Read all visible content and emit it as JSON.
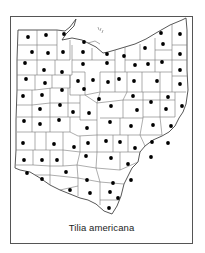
{
  "map": {
    "title": "Tilia americana",
    "region": "Ohio",
    "subdivision": "counties",
    "colors": {
      "border": "#555555",
      "county_lines": "#777777",
      "dot": "#000000",
      "background": "#ffffff"
    },
    "dots": [
      [
        28,
        37
      ],
      [
        46,
        35
      ],
      [
        64,
        34
      ],
      [
        84,
        42
      ],
      [
        161,
        33
      ],
      [
        180,
        34
      ],
      [
        32,
        52
      ],
      [
        48,
        53
      ],
      [
        63,
        52
      ],
      [
        83,
        52
      ],
      [
        107,
        54
      ],
      [
        145,
        48
      ],
      [
        163,
        44
      ],
      [
        25,
        63
      ],
      [
        44,
        70
      ],
      [
        62,
        72
      ],
      [
        83,
        64
      ],
      [
        107,
        63
      ],
      [
        124,
        56
      ],
      [
        135,
        65
      ],
      [
        148,
        64
      ],
      [
        162,
        62
      ],
      [
        180,
        54
      ],
      [
        26,
        79
      ],
      [
        45,
        83
      ],
      [
        78,
        81
      ],
      [
        93,
        80
      ],
      [
        108,
        82
      ],
      [
        119,
        79
      ],
      [
        134,
        81
      ],
      [
        157,
        81
      ],
      [
        180,
        70
      ],
      [
        23,
        96
      ],
      [
        42,
        95
      ],
      [
        62,
        90
      ],
      [
        84,
        89
      ],
      [
        99,
        99
      ],
      [
        133,
        96
      ],
      [
        151,
        102
      ],
      [
        168,
        97
      ],
      [
        180,
        84
      ],
      [
        40,
        109
      ],
      [
        60,
        105
      ],
      [
        73,
        112
      ],
      [
        89,
        113
      ],
      [
        111,
        106
      ],
      [
        137,
        110
      ],
      [
        166,
        109
      ],
      [
        182,
        106
      ],
      [
        24,
        121
      ],
      [
        40,
        124
      ],
      [
        59,
        120
      ],
      [
        87,
        128
      ],
      [
        110,
        122
      ],
      [
        131,
        126
      ],
      [
        153,
        125
      ],
      [
        171,
        126
      ],
      [
        23,
        143
      ],
      [
        54,
        144
      ],
      [
        74,
        147
      ],
      [
        88,
        143
      ],
      [
        106,
        141
      ],
      [
        120,
        142
      ],
      [
        135,
        148
      ],
      [
        152,
        142
      ],
      [
        168,
        143
      ],
      [
        24,
        160
      ],
      [
        42,
        160
      ],
      [
        57,
        160
      ],
      [
        86,
        156
      ],
      [
        111,
        158
      ],
      [
        128,
        164
      ],
      [
        151,
        157
      ],
      [
        27,
        173
      ],
      [
        42,
        179
      ],
      [
        66,
        172
      ],
      [
        87,
        180
      ],
      [
        113,
        183
      ],
      [
        131,
        180
      ],
      [
        70,
        190
      ],
      [
        90,
        193
      ],
      [
        110,
        192
      ],
      [
        118,
        198
      ],
      [
        109,
        208
      ]
    ]
  }
}
